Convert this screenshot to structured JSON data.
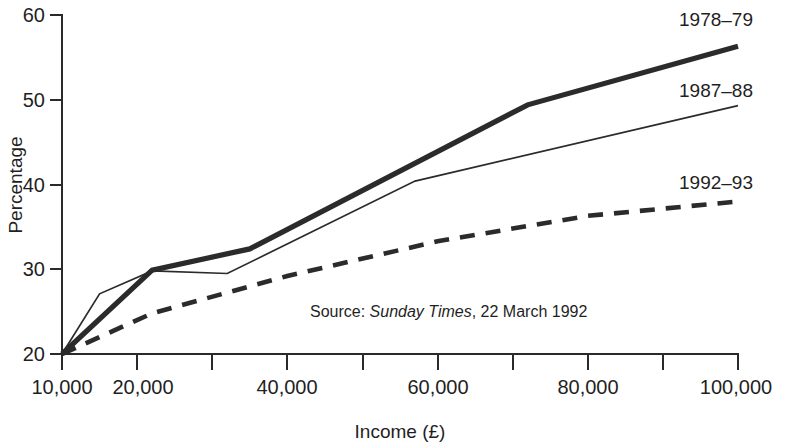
{
  "chart_data": {
    "type": "line",
    "title": "",
    "xlabel": "Income (£)",
    "ylabel": "Percentage",
    "xlim": [
      10000,
      100000
    ],
    "ylim": [
      20,
      60
    ],
    "grid": false,
    "legend_position": "right-of-lines (inline end labels)",
    "x_tick_values": [
      10000,
      20000,
      30000,
      40000,
      50000,
      60000,
      70000,
      80000,
      90000,
      100000
    ],
    "x_tick_labels": [
      "10,000",
      "20,000",
      "",
      "40,000",
      "",
      "60,000",
      "",
      "80,000",
      "",
      "100,000"
    ],
    "y_tick_values": [
      20,
      30,
      40,
      50,
      60
    ],
    "y_tick_labels": [
      "20",
      "30",
      "40",
      "50",
      "60"
    ],
    "annotation": {
      "prefix": "Source: ",
      "italic": "Sunday Times",
      "suffix": ", 22 March 1992"
    },
    "series": [
      {
        "name": "1978-79",
        "label": "1978–79",
        "style": "thick-solid",
        "color": "#2b2b2b",
        "x": [
          10000,
          22000,
          35000,
          72000,
          100000
        ],
        "values": [
          20.0,
          29.9,
          32.4,
          49.4,
          56.3
        ]
      },
      {
        "name": "1987-88",
        "label": "1987–88",
        "style": "thin-solid",
        "color": "#2b2b2b",
        "x": [
          10000,
          15000,
          22000,
          32000,
          57000,
          100000
        ],
        "values": [
          20.0,
          27.1,
          29.8,
          29.5,
          40.4,
          49.3
        ]
      },
      {
        "name": "1992-93",
        "label": "1992–93",
        "style": "dashed",
        "color": "#2b2b2b",
        "x": [
          10000,
          22000,
          40000,
          60000,
          80000,
          100000
        ],
        "values": [
          20.0,
          24.8,
          29.2,
          33.3,
          36.3,
          38.0
        ]
      }
    ]
  },
  "axes": {
    "y_title": "Percentage",
    "x_title": "Income (£)"
  },
  "series_labels": {
    "s1": "1978–79",
    "s2": "1987–88",
    "s3": "1992–93"
  },
  "ticks": {
    "y": [
      "60",
      "50",
      "40",
      "30",
      "20"
    ],
    "x": [
      "10,000",
      "20,000",
      "40,000",
      "60,000",
      "80,000",
      "100,000"
    ]
  },
  "source": {
    "prefix": "Source: ",
    "italic": "Sunday Times",
    "suffix": ", 22 March 1992"
  }
}
